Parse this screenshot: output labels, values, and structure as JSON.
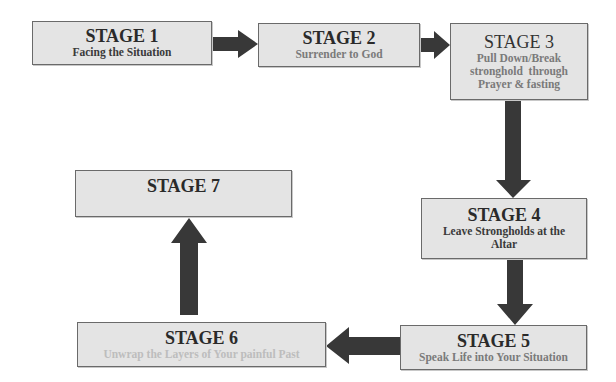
{
  "diagram": {
    "type": "flowchart",
    "colors": {
      "box_fill": "#e4e4e4",
      "box_border": "#6a6a6a",
      "arrow": "#383838"
    },
    "stages": [
      {
        "title": "STAGE 1",
        "subtitle": "Facing the Situation"
      },
      {
        "title": "STAGE 2",
        "subtitle": "Surrender to God"
      },
      {
        "title": "STAGE 3",
        "subtitle_lines": [
          "Pull Down/Break",
          "stronghold  through",
          "Prayer & fasting"
        ]
      },
      {
        "title": "STAGE 4",
        "subtitle_lines": [
          "Leave Strongholds at the",
          "Altar"
        ]
      },
      {
        "title": "STAGE 5",
        "subtitle": "Speak Life into Your Situation"
      },
      {
        "title": "STAGE 6",
        "subtitle": "Unwrap the Layers of Your painful Past"
      },
      {
        "title": "STAGE 7",
        "subtitle": ""
      }
    ],
    "flow": [
      "STAGE 1 -> STAGE 2",
      "STAGE 2 -> STAGE 3",
      "STAGE 3 -> STAGE 4",
      "STAGE 4 -> STAGE 5",
      "STAGE 5 -> STAGE 6",
      "STAGE 6 -> STAGE 7"
    ]
  }
}
